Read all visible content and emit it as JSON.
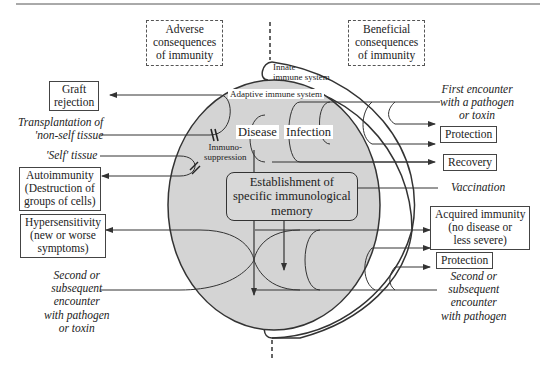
{
  "header": {
    "adverse": "Adverse consequences of immunity",
    "adverse_lines": [
      "Adverse",
      "consequences",
      "of immunity"
    ],
    "beneficial_lines": [
      "Beneficial",
      "consequences",
      "of immunity"
    ]
  },
  "systems": {
    "innate_lines": [
      "Innate",
      "immune system"
    ],
    "adaptive": "Adaptive immune system"
  },
  "center": {
    "disease": "Disease",
    "infection": "Infection",
    "immunosuppression_lines": [
      "Immuno-",
      "suppression"
    ],
    "memory_lines": [
      "Establishment of",
      "specific immunological",
      "memory"
    ]
  },
  "left": {
    "graft_lines": [
      "Graft",
      "rejection"
    ],
    "transplant_lines": [
      "Transplantation of",
      "'non-self tissue"
    ],
    "self_tissue": "'Self' tissue",
    "autoimmunity_lines": [
      "Autoimmunity",
      "(Destruction of",
      "groups of cells)"
    ],
    "hypersensitivity_lines": [
      "Hypersensitivity",
      "(new or worse",
      "symptoms)"
    ],
    "second_encounter_lines": [
      "Second or",
      "subsequent",
      "encounter",
      "with pathogen",
      "or toxin"
    ]
  },
  "right": {
    "first_encounter_lines": [
      "First encounter",
      "with a pathogen",
      "or toxin"
    ],
    "protection_1": "Protection",
    "recovery": "Recovery",
    "vaccination": "Vaccination",
    "acquired_lines": [
      "Acquired immunity",
      "(no disease or",
      "less severe)"
    ],
    "protection_2": "Protection",
    "second_encounter_lines": [
      "Second or",
      "subsequent",
      "encounter",
      "with pathogen"
    ]
  },
  "colors": {
    "adaptive_fill": "#d4d4d4",
    "stroke": "#333333",
    "background": "#ffffff"
  }
}
